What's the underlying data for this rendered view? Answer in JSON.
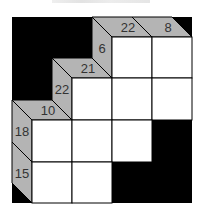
{
  "puzzle": {
    "type": "kakuro",
    "colors": {
      "background": "#000000",
      "clue_fill": "#b4b4b4",
      "cell_fill": "#ffffff",
      "line": "#000000",
      "text": "#333333"
    },
    "geometry": {
      "origin_x": 12,
      "origin_y": 17,
      "strip": 20,
      "col_x": [
        32,
        72,
        112,
        152,
        192
      ],
      "row_y": [
        37,
        78,
        120,
        162,
        203
      ]
    },
    "white_cells": [
      {
        "row": 0,
        "col": 2
      },
      {
        "row": 0,
        "col": 3
      },
      {
        "row": 1,
        "col": 1
      },
      {
        "row": 1,
        "col": 2
      },
      {
        "row": 1,
        "col": 3
      },
      {
        "row": 2,
        "col": 0
      },
      {
        "row": 2,
        "col": 1
      },
      {
        "row": 2,
        "col": 2
      },
      {
        "row": 3,
        "col": 0
      },
      {
        "row": 3,
        "col": 1
      }
    ],
    "down_clues": [
      {
        "col": 2,
        "row": 0,
        "value": "22"
      },
      {
        "col": 3,
        "row": 0,
        "value": "8"
      },
      {
        "col": 1,
        "row": 1,
        "value": "21"
      },
      {
        "col": 0,
        "row": 2,
        "value": "10"
      }
    ],
    "across_clues": [
      {
        "row": 0,
        "col": 2,
        "value": "6"
      },
      {
        "row": 1,
        "col": 1,
        "value": "22"
      },
      {
        "row": 2,
        "col": 0,
        "value": "18"
      },
      {
        "row": 3,
        "col": 0,
        "value": "15"
      }
    ]
  }
}
